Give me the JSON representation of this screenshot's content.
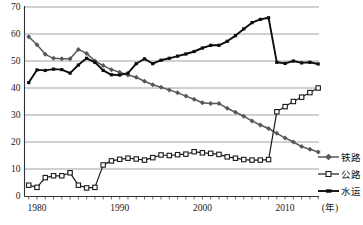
{
  "chart_data": {
    "type": "line",
    "title": "",
    "xlabel": "",
    "ylabel": "",
    "x_axis_unit": "(年)",
    "ylim": [
      0,
      70
    ],
    "y_ticks": [
      0,
      10,
      20,
      30,
      40,
      50,
      60,
      70
    ],
    "x_labeled_ticks": [
      1980,
      1990,
      2000,
      2010
    ],
    "grid": true,
    "legend_position": "right-bottom",
    "x": [
      1979,
      1980,
      1981,
      1982,
      1983,
      1984,
      1985,
      1986,
      1987,
      1988,
      1989,
      1990,
      1991,
      1992,
      1993,
      1994,
      1995,
      1996,
      1997,
      1998,
      1999,
      2000,
      2001,
      2002,
      2003,
      2004,
      2005,
      2006,
      2007,
      2008,
      2009,
      2010,
      2011,
      2012,
      2013,
      2014
    ],
    "series": [
      {
        "name": "铁路",
        "marker": "diamond",
        "color": "#585858",
        "line_width": 1.5,
        "values": [
          59,
          56,
          52.5,
          51,
          50.8,
          50.8,
          54.3,
          52.8,
          50,
          48.3,
          46.8,
          45.8,
          44.8,
          44,
          42.5,
          41.2,
          40.3,
          39.3,
          38.2,
          37,
          35.8,
          34.5,
          34.3,
          34.3,
          32.5,
          31,
          29.5,
          27.8,
          26.3,
          25,
          23.2,
          21.5,
          20,
          18.3,
          17.3,
          16.3
        ]
      },
      {
        "name": "公路",
        "marker": "open-square",
        "color": "#1a1a1a",
        "marker_fill": "#ffffff",
        "line_width": 1.2,
        "values": [
          4,
          3.2,
          6.8,
          7.5,
          7.5,
          8.6,
          4,
          3,
          3.2,
          11.5,
          13,
          13.6,
          14,
          13.7,
          13.3,
          14.2,
          15.2,
          15,
          15.3,
          15.5,
          16.4,
          16,
          15.8,
          15.4,
          14.5,
          14,
          13.5,
          13.3,
          13.3,
          13.5,
          31.2,
          33.1,
          35,
          36.6,
          38.3,
          40
        ]
      },
      {
        "name": "水运",
        "marker": "filled-square",
        "color": "#0d0d0d",
        "line_width": 1.9,
        "values": [
          42,
          46.7,
          46.5,
          47,
          46.8,
          45.5,
          48.5,
          51,
          49.5,
          46.5,
          44.9,
          44.8,
          45.5,
          49,
          50.8,
          49,
          50.3,
          51,
          51.8,
          52.6,
          53.5,
          54.8,
          55.8,
          55.8,
          57.3,
          59.4,
          61.9,
          64.2,
          65.4,
          66,
          49.5,
          49.1,
          50,
          49.3,
          49.5,
          48.9
        ]
      }
    ],
    "axis_color": "#333333",
    "gridline_color": "#8c8c8c"
  }
}
